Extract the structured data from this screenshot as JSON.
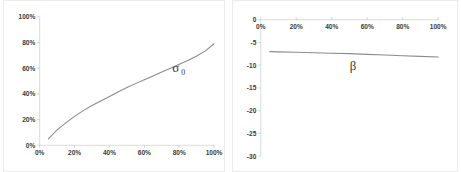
{
  "figure": {
    "background_color": "#ffffff",
    "panel_border_color": "#ececec",
    "curve_color": "#8c8c8c",
    "axis_color": "#d0d0d0",
    "tick_label_color": "#3b3b3b"
  },
  "chart_data": [
    {
      "type": "line",
      "title": "",
      "xlabel": "",
      "ylabel": "",
      "grid": false,
      "legend": "inline-annotation",
      "annotations": [
        {
          "text": "σ",
          "subscript": "0",
          "x": 78,
          "y": 57
        }
      ],
      "xlim": [
        0,
        100
      ],
      "ylim": [
        0,
        100
      ],
      "xticks": [
        "0%",
        "20%",
        "40%",
        "60%",
        "80%",
        "100%"
      ],
      "xtick_values": [
        0,
        20,
        40,
        60,
        80,
        100
      ],
      "yticks": [
        "0%",
        "20%",
        "40%",
        "60%",
        "80%",
        "100%"
      ],
      "ytick_values": [
        0,
        20,
        40,
        60,
        80,
        100
      ],
      "x_axis_position": "bottom",
      "y_axis_position": "left",
      "series": [
        {
          "name": "sigma_0",
          "x": [
            5,
            10,
            15,
            20,
            25,
            30,
            35,
            40,
            45,
            50,
            55,
            60,
            65,
            70,
            75,
            80,
            85,
            90,
            95,
            100
          ],
          "values": [
            5,
            12,
            17.5,
            22.5,
            27,
            31,
            34.5,
            38,
            41.5,
            45,
            48,
            51,
            54,
            57,
            60,
            63,
            66,
            69.5,
            73.5,
            79
          ]
        }
      ]
    },
    {
      "type": "line",
      "title": "",
      "xlabel": "",
      "ylabel": "",
      "grid": false,
      "legend": "inline-annotation",
      "annotations": [
        {
          "text": "β",
          "subscript": "",
          "x": 52,
          "y": -11
        }
      ],
      "xlim": [
        0,
        100
      ],
      "ylim": [
        -30,
        0
      ],
      "xticks": [
        "0%",
        "20%",
        "40%",
        "60%",
        "80%",
        "100%"
      ],
      "xtick_values": [
        0,
        20,
        40,
        60,
        80,
        100
      ],
      "yticks": [
        "0",
        "-5",
        "-10",
        "-15",
        "-20",
        "-25",
        "-30"
      ],
      "ytick_values": [
        0,
        -5,
        -10,
        -15,
        -20,
        -25,
        -30
      ],
      "x_axis_position": "top",
      "y_axis_position": "left",
      "series": [
        {
          "name": "beta",
          "x": [
            5,
            10,
            20,
            30,
            40,
            50,
            60,
            70,
            80,
            90,
            100
          ],
          "values": [
            -7.0,
            -7.05,
            -7.15,
            -7.25,
            -7.35,
            -7.45,
            -7.6,
            -7.75,
            -7.9,
            -8.05,
            -8.2
          ]
        }
      ]
    }
  ]
}
